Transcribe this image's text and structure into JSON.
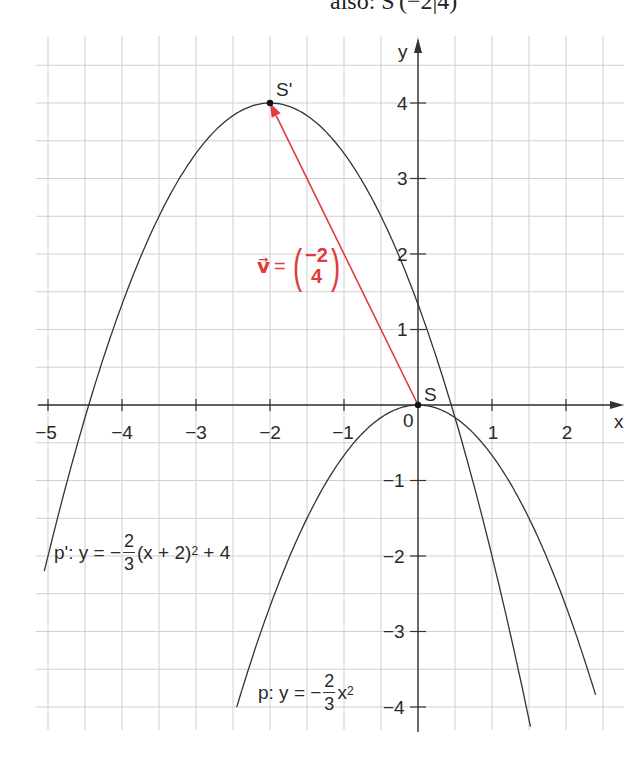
{
  "caption": {
    "text": "also: S'(−2|4)"
  },
  "chart_data": {
    "type": "line",
    "title": "",
    "xlabel": "x",
    "ylabel": "y",
    "xlim": [
      -5.2,
      2.8
    ],
    "ylim": [
      -4.3,
      4.9
    ],
    "grid": true,
    "grid_step": 0.5,
    "x_ticks": [
      -5,
      -4,
      -3,
      -2,
      -1,
      0,
      1,
      2
    ],
    "x_tick_labels": [
      "−5",
      "−4",
      "−3",
      "−2",
      "−1",
      "0",
      "1",
      "2"
    ],
    "y_ticks": [
      -4,
      -3,
      -2,
      -1,
      1,
      2,
      3,
      4
    ],
    "y_tick_labels": [
      "−4",
      "−3",
      "−2",
      "−1",
      "1",
      "2",
      "3",
      "4"
    ],
    "series": [
      {
        "name": "p",
        "equation": "y = −2/3·x²",
        "vertex": [
          0,
          0
        ],
        "x_range": [
          -2.45,
          2.4
        ],
        "color": "#333333"
      },
      {
        "name": "p'",
        "equation": "y = −2/3·(x+2)² + 4",
        "vertex": [
          -2,
          4
        ],
        "x_range": [
          -5.05,
          1.52
        ],
        "color": "#333333"
      }
    ],
    "points": [
      {
        "label": "S",
        "x": 0,
        "y": 0
      },
      {
        "label": "S'",
        "x": -2,
        "y": 4
      }
    ],
    "vector": {
      "label": "v⃗",
      "components": [
        -2,
        4
      ],
      "from": [
        0,
        0
      ],
      "to": [
        -2,
        4
      ],
      "color": "#e03c3c"
    },
    "annotations": [
      {
        "text": "p': y = −2/3(x + 2)² + 4",
        "x": -4.9,
        "y": -1.8
      },
      {
        "text": "p: y = −2/3x²",
        "x": -2.2,
        "y": -3.7
      }
    ]
  },
  "labels": {
    "axis_x": "x",
    "axis_y": "y",
    "point_s": "S",
    "point_s_prime": "S'",
    "origin": "0",
    "xticks": [
      "−5",
      "−4",
      "−3",
      "−2",
      "−1",
      "1",
      "2"
    ],
    "yticks": [
      "4",
      "3",
      "2",
      "1",
      "−1",
      "−2",
      "−3",
      "−4"
    ],
    "vector": {
      "name": "v⃗",
      "eq": "=",
      "top": "−2",
      "bottom": "4"
    },
    "p_prime": {
      "lhs": "p': y = −",
      "num": "2",
      "den": "3",
      "rhs_a": "(x + 2)",
      "sup": "2",
      "rhs_b": " + 4"
    },
    "p": {
      "lhs": "p: y = −",
      "num": "2",
      "den": "3",
      "rhs_a": "x",
      "sup": "2"
    }
  },
  "colors": {
    "vector": "#e03c3c",
    "grid": "#cfcfcf",
    "axis": "#333333",
    "curve": "#333333"
  }
}
